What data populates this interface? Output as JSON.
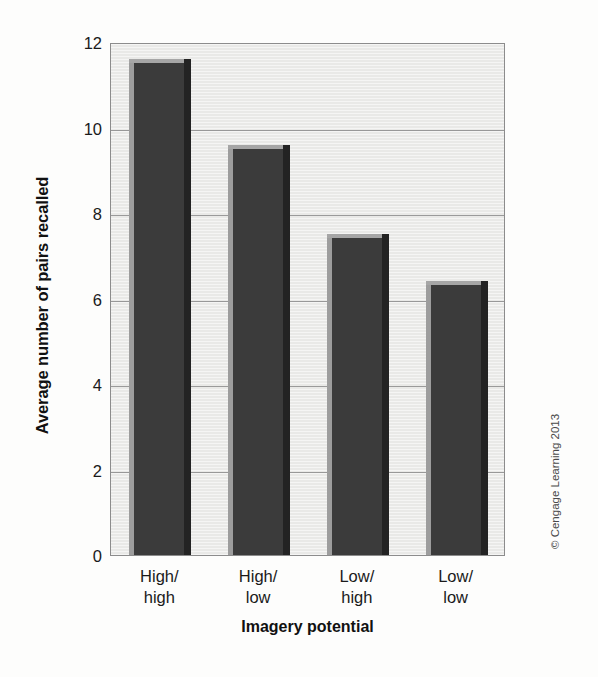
{
  "chart_data": {
    "type": "bar",
    "title": "",
    "categories": [
      "High/\nhigh",
      "High/\nlow",
      "Low/\nhigh",
      "Low/\nlow"
    ],
    "values": [
      11.6,
      9.6,
      7.5,
      6.4
    ],
    "xlabel": "Imagery potential",
    "ylabel": "Average number of pairs recalled",
    "ylim": [
      0,
      12
    ],
    "yticks": [
      0,
      2,
      4,
      6,
      8,
      10,
      12
    ],
    "ytick_labels": [
      "0",
      "2",
      "4",
      "6",
      "8",
      "10",
      "12"
    ],
    "grid": true,
    "legend": false,
    "bar_color": "#3b3b3b",
    "plot_background": "#e9e9e7"
  },
  "credit": {
    "text": "© Cengage Learning 2013"
  }
}
